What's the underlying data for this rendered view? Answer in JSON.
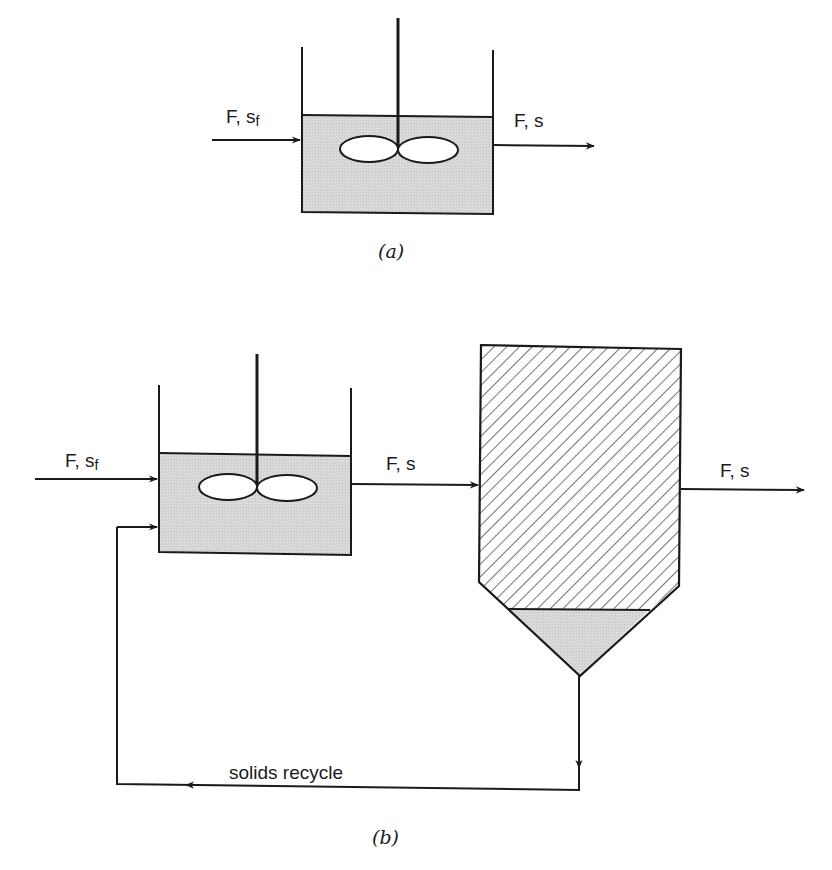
{
  "figure": {
    "panel_a": {
      "caption": "(a)",
      "inlet_label": {
        "main": "F, s",
        "sub": "f"
      },
      "outlet_label": "F, s",
      "components": [
        "stirred-tank-reactor",
        "impeller",
        "shaft",
        "inlet-stream",
        "outlet-stream"
      ]
    },
    "panel_b": {
      "caption": "(b)",
      "inlet_label": {
        "main": "F, s",
        "sub": "f"
      },
      "reactor_outlet_label": "F, s",
      "settler_outlet_label": "F, s",
      "recycle_label": "solids recycle",
      "components": [
        "stirred-tank-reactor",
        "impeller",
        "shaft",
        "settler",
        "settled-solids",
        "recycle-line"
      ]
    },
    "colors": {
      "line": "#1a1a1a",
      "liquid_fill": "#d9d9d9",
      "solids_fill": "#d6d6d6",
      "hatch": "#2a2a2a",
      "background": "#ffffff"
    }
  }
}
